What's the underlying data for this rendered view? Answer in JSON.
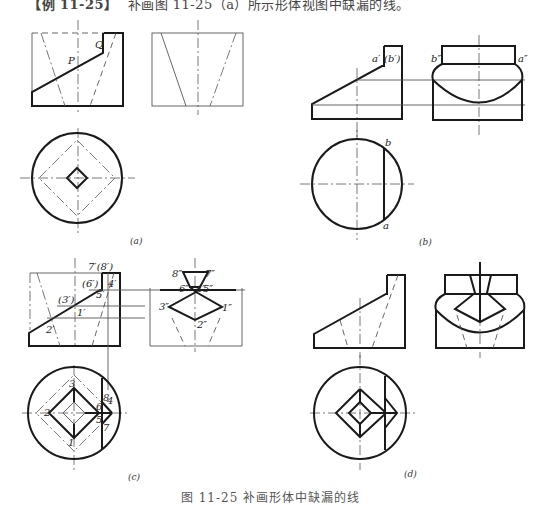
{
  "header": {
    "tag": "【例 11-25】",
    "text": "补画图 11-25（a）所示形体视图中缺漏的线。"
  },
  "subfigures": {
    "a": {
      "label": "(a)",
      "annotations": [
        "P",
        "Q"
      ]
    },
    "b": {
      "label": "(b)",
      "annotations": [
        "a′",
        "(b′)",
        "b″",
        "a″",
        "b",
        "a"
      ]
    },
    "c": {
      "label": "(c)",
      "annotations": [
        "7′(8′)",
        "(6′)",
        "4′",
        "5′",
        "(3′)",
        "1′",
        "2′",
        "8″",
        "7″",
        "6″",
        "4″",
        "5″",
        "3″",
        "1″",
        "2″",
        "3",
        "2",
        "1",
        "8",
        "4",
        "6",
        "5",
        "7"
      ]
    },
    "d": {
      "label": "(d)"
    }
  },
  "caption": "图 11-25  补画形体中缺漏的线"
}
